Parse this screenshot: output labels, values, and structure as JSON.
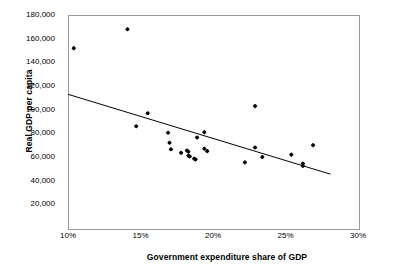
{
  "chart_data": {
    "type": "scatter",
    "title": "",
    "xlabel": "Government expenditure share of GDP",
    "ylabel": "Real GDP per capita",
    "xlim": [
      10,
      30
    ],
    "ylim": [
      0,
      180000
    ],
    "grid": false,
    "legend": null,
    "x_tick_labels": [
      "10%",
      "15%",
      "20%",
      "25%",
      "30%"
    ],
    "x_ticks": [
      10,
      15,
      20,
      25,
      30
    ],
    "y_tick_labels": [
      "20,000",
      "40,000",
      "60,000",
      "80,000",
      "100,000",
      "120,000",
      "140,000",
      "160,000",
      "180,000"
    ],
    "y_ticks": [
      20000,
      40000,
      60000,
      80000,
      100000,
      120000,
      140000,
      160000,
      180000
    ],
    "points": [
      {
        "x": 10.4,
        "y": 152000
      },
      {
        "x": 14.1,
        "y": 168000
      },
      {
        "x": 14.7,
        "y": 86000
      },
      {
        "x": 15.5,
        "y": 97000
      },
      {
        "x": 16.9,
        "y": 80500
      },
      {
        "x": 17.0,
        "y": 72000
      },
      {
        "x": 17.1,
        "y": 66500
      },
      {
        "x": 17.8,
        "y": 63500
      },
      {
        "x": 18.2,
        "y": 65500
      },
      {
        "x": 18.3,
        "y": 64500
      },
      {
        "x": 18.3,
        "y": 61000
      },
      {
        "x": 18.4,
        "y": 60500
      },
      {
        "x": 18.7,
        "y": 58500
      },
      {
        "x": 18.8,
        "y": 58000
      },
      {
        "x": 18.9,
        "y": 76500
      },
      {
        "x": 19.4,
        "y": 81000
      },
      {
        "x": 19.4,
        "y": 67000
      },
      {
        "x": 19.6,
        "y": 65000
      },
      {
        "x": 22.2,
        "y": 55500
      },
      {
        "x": 22.9,
        "y": 103000
      },
      {
        "x": 22.9,
        "y": 68000
      },
      {
        "x": 23.4,
        "y": 60000
      },
      {
        "x": 25.4,
        "y": 62000
      },
      {
        "x": 26.2,
        "y": 54500
      },
      {
        "x": 26.2,
        "y": 52500
      },
      {
        "x": 26.9,
        "y": 70000
      }
    ],
    "trendline": {
      "x_start": 10.0,
      "y_start": 113000,
      "x_end": 28.1,
      "y_end": 45500
    }
  }
}
